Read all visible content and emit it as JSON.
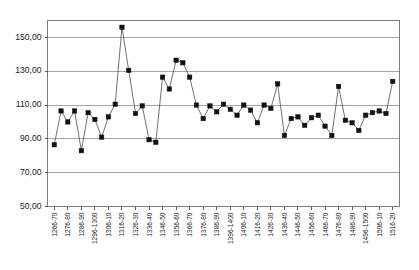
{
  "chart_data": {
    "type": "line",
    "title": "",
    "subtitle": "",
    "xlabel": "",
    "ylabel": "",
    "ylim": [
      50,
      160
    ],
    "yticks": [
      50,
      70,
      90,
      110,
      130,
      150
    ],
    "ytick_labels": [
      "50,00",
      "70,00",
      "90,00",
      "110,00",
      "130,00",
      "150,00"
    ],
    "grid": true,
    "legend": false,
    "legend_position": "none",
    "marker": "square",
    "marker_color": "#111111",
    "line_color": "#4d4d4d",
    "categories": [
      "1266-70",
      "1276-80",
      "1286-90",
      "1296-1300",
      "1306-10",
      "1316-20",
      "1326-30",
      "1336-40",
      "1346-50",
      "1356-60",
      "1366-70",
      "1376-80",
      "1386-90",
      "1396-1400",
      "1406-10",
      "1416-20",
      "1426-30",
      "1436-40",
      "1446-50",
      "1456-60",
      "1466-70",
      "1476-80",
      "1486-90",
      "1496-1500",
      "1506-10",
      "1516-20"
    ],
    "values": [
      86.5,
      106.5,
      100.0,
      106.0,
      83.0,
      105.5,
      101.5,
      91.0,
      103.0,
      110.5,
      156.0,
      130.5,
      105.0,
      109.5,
      89.5,
      88.0,
      126.5,
      119.5,
      136.5,
      135.0,
      126.5,
      110.0,
      102.0,
      109.5,
      106.0,
      104.0
    ],
    "series": [
      {
        "name": "series-1",
        "values": [
          86.5,
          106.5,
          100.0,
          106.0,
          83.0,
          105.5,
          101.5,
          91.0,
          103.0,
          110.5,
          156.0,
          130.5,
          105.0,
          109.5,
          89.5,
          88.0,
          126.5,
          119.5,
          136.5,
          135.0,
          126.5,
          110.0,
          102.0,
          109.5,
          106.0,
          104.0
        ]
      }
    ],
    "full_series": {
      "x_labels": [
        "1266-70",
        "1271-75",
        "1276-80",
        "1281-85",
        "1286-90",
        "1291-95",
        "1296-1300",
        "1301-05",
        "1306-10",
        "1311-15",
        "1316-20",
        "1321-25",
        "1326-30",
        "1331-35",
        "1336-40",
        "1341-45",
        "1346-50",
        "1351-55",
        "1356-60",
        "1361-65",
        "1366-70",
        "1371-75",
        "1376-80",
        "1381-85",
        "1386-90",
        "1391-95",
        "1396-1400",
        "1401-05",
        "1406-10",
        "1411-15",
        "1416-20",
        "1421-25",
        "1426-30",
        "1431-35",
        "1436-40",
        "1441-45",
        "1446-50",
        "1451-55",
        "1456-60",
        "1461-65",
        "1466-70",
        "1471-75",
        "1476-80",
        "1481-85",
        "1486-90",
        "1491-95",
        "1496-1500",
        "1501-05",
        "1506-10",
        "1511-15",
        "1516-20"
      ],
      "y_values": [
        86.5,
        106.5,
        100.0,
        106.5,
        83.0,
        105.5,
        101.5,
        91.0,
        103.0,
        110.5,
        156.0,
        130.5,
        105.0,
        109.5,
        89.5,
        88.0,
        126.5,
        119.5,
        136.5,
        135.0,
        126.5,
        110.0,
        102.0,
        109.5,
        106.0,
        110.5,
        107.5,
        104.0,
        110.0,
        107.0,
        99.5,
        110.0,
        108.0,
        122.5,
        92.0,
        102.0,
        103.0,
        98.0,
        102.5,
        104.0,
        97.5,
        92.0,
        121.0,
        101.0,
        99.5,
        95.0,
        104.0,
        105.5,
        106.5,
        105.0,
        124.0
      ]
    }
  }
}
